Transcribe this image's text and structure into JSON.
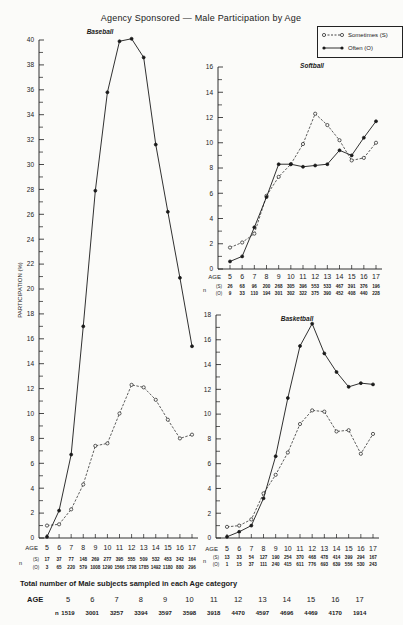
{
  "figure_title": "Agency Sponsored — Male Participation by Age",
  "y_axis_label": "PARTICIPATION (%)",
  "legend": {
    "sometimes": "Sometimes (S)",
    "often": "Often (O)"
  },
  "row_labels": {
    "age": "AGE",
    "n": "n",
    "s": "(S)",
    "o": "(O)"
  },
  "totals": {
    "title": "Total number of Male subjects sampled in each Age category",
    "age_label": "AGE",
    "n_label": "n",
    "ages": [
      5,
      6,
      7,
      8,
      9,
      10,
      11,
      12,
      13,
      14,
      15,
      16,
      17
    ],
    "n": [
      1519,
      3001,
      3257,
      3394,
      3597,
      3598,
      3918,
      4470,
      4597,
      4696,
      4469,
      4170,
      1914
    ]
  },
  "colors": {
    "line": "#1a1a1a",
    "background": "#fbfbf9"
  },
  "chart_data": [
    {
      "type": "line",
      "title": "Baseball",
      "xlabel": "AGE",
      "ylabel": "PARTICIPATION (%)",
      "x": [
        5,
        6,
        7,
        8,
        9,
        10,
        11,
        12,
        13,
        14,
        15,
        16,
        17
      ],
      "ylim": [
        0,
        40
      ],
      "yticks": [
        0,
        2,
        4,
        6,
        8,
        10,
        12,
        14,
        16,
        18,
        20,
        22,
        24,
        26,
        28,
        30,
        32,
        34,
        36,
        38,
        40
      ],
      "series": [
        {
          "name": "Sometimes (S)",
          "style": "dashed-open-circle",
          "values": [
            1.0,
            1.1,
            2.3,
            4.3,
            7.4,
            7.6,
            10.0,
            12.3,
            12.1,
            11.1,
            9.5,
            8.0,
            8.3
          ],
          "n": [
            17,
            37,
            77,
            148,
            269,
            277,
            395,
            555,
            509,
            532,
            453,
            342,
            164
          ]
        },
        {
          "name": "Often (O)",
          "style": "solid-filled-circle",
          "values": [
            0.1,
            2.2,
            6.7,
            17.0,
            27.9,
            35.8,
            39.9,
            40.1,
            38.6,
            31.6,
            26.2,
            20.9,
            15.4
          ],
          "n": [
            3,
            65,
            220,
            579,
            1008,
            1290,
            1566,
            1798,
            1785,
            1492,
            1180,
            880,
            296
          ]
        }
      ]
    },
    {
      "type": "line",
      "title": "Softball",
      "xlabel": "AGE",
      "ylabel": "PARTICIPATION (%)",
      "x": [
        5,
        6,
        7,
        8,
        9,
        10,
        11,
        12,
        13,
        14,
        15,
        16,
        17
      ],
      "ylim": [
        0,
        16
      ],
      "yticks": [
        0,
        2,
        4,
        6,
        8,
        10,
        12,
        14,
        16
      ],
      "series": [
        {
          "name": "Sometimes (S)",
          "style": "dashed-open-circle",
          "values": [
            1.7,
            2.1,
            2.8,
            5.8,
            7.3,
            8.3,
            9.9,
            12.3,
            11.4,
            10.2,
            8.6,
            8.8,
            10.0
          ],
          "n": [
            26,
            68,
            96,
            200,
            268,
            305,
            396,
            553,
            533,
            467,
            391,
            376,
            196
          ]
        },
        {
          "name": "Often (O)",
          "style": "solid-filled-circle",
          "values": [
            0.6,
            1.0,
            3.3,
            5.7,
            8.3,
            8.3,
            8.1,
            8.2,
            8.3,
            9.4,
            9.0,
            10.4,
            11.7
          ],
          "n": [
            9,
            33,
            110,
            194,
            301,
            302,
            322,
            375,
            390,
            452,
            408,
            440,
            228
          ]
        }
      ]
    },
    {
      "type": "line",
      "title": "Basketball",
      "xlabel": "AGE",
      "ylabel": "PARTICIPATION (%)",
      "x": [
        5,
        6,
        7,
        8,
        9,
        10,
        11,
        12,
        13,
        14,
        15,
        16,
        17
      ],
      "ylim": [
        0,
        18
      ],
      "yticks": [
        0,
        2,
        4,
        6,
        8,
        10,
        12,
        14,
        16,
        18
      ],
      "series": [
        {
          "name": "Sometimes (S)",
          "style": "dashed-open-circle",
          "values": [
            0.9,
            1.0,
            1.5,
            3.6,
            5.1,
            6.9,
            9.2,
            10.3,
            10.2,
            8.6,
            8.7,
            6.8,
            8.4
          ],
          "n": [
            13,
            33,
            54,
            127,
            190,
            254,
            370,
            468,
            478,
            414,
            399,
            294,
            167
          ]
        },
        {
          "name": "Often (O)",
          "style": "solid-filled-circle",
          "values": [
            0.1,
            0.5,
            1.0,
            3.2,
            6.6,
            11.3,
            15.5,
            17.3,
            14.9,
            13.4,
            12.2,
            12.5,
            12.4
          ],
          "n": [
            1,
            15,
            37,
            111,
            240,
            415,
            611,
            776,
            693,
            639,
            556,
            530,
            243
          ]
        }
      ]
    }
  ]
}
